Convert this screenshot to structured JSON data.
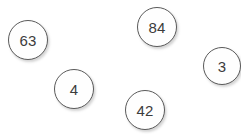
{
  "canvas": {
    "width": 241,
    "height": 134,
    "background_color": "#ffffff",
    "node_fill_color": "#fefefe",
    "node_border_color": "#5a5a5a",
    "node_text_color": "#3c3c3c"
  },
  "nodes": [
    {
      "label": "63",
      "x": 8,
      "y": 20,
      "size": 40
    },
    {
      "label": "84",
      "x": 137,
      "y": 7,
      "size": 40
    },
    {
      "label": "3",
      "x": 203,
      "y": 47,
      "size": 38
    },
    {
      "label": "4",
      "x": 54,
      "y": 69,
      "size": 40
    },
    {
      "label": "42",
      "x": 125,
      "y": 90,
      "size": 40
    }
  ]
}
